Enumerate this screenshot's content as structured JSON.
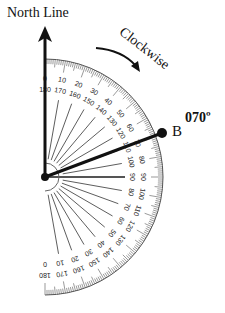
{
  "diagram": {
    "north_label": "North Line",
    "direction_label": "Clockwise",
    "bearing_label": "070º",
    "point_label": "B",
    "bearing_degrees": 70,
    "protractor": {
      "type": "semicircle",
      "orientation": "right-half, 0 at north",
      "outer_scale": [
        0,
        10,
        20,
        30,
        40,
        50,
        60,
        70,
        80,
        90,
        100,
        110,
        120,
        130,
        140,
        150,
        160,
        170,
        180
      ],
      "inner_scale": [
        180,
        170,
        160,
        150,
        140,
        130,
        120,
        110,
        100,
        90,
        80,
        70,
        60,
        50,
        40,
        30,
        20,
        10,
        0
      ]
    },
    "colors": {
      "line": "#111111",
      "scale": "#555555"
    }
  }
}
